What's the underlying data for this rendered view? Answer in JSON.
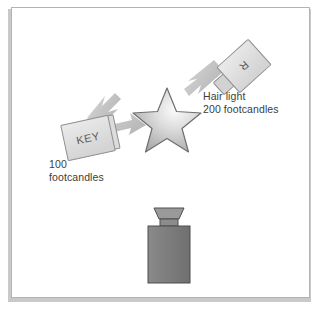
{
  "diagram": {
    "background_color": "#ffffff",
    "frame_border_color": "#b3b3b3",
    "shadow_color": "#c9c9c9",
    "text_color": "#3c3c3c"
  },
  "lights": [
    {
      "id": "key",
      "box_label": "KEY",
      "caption_line1": "100",
      "caption_line2": "footcandles",
      "intensity_value": 100,
      "intensity_unit": "footcandles",
      "box_fill": "#e3e3e3",
      "box_stroke": "#8f8f8f",
      "rotation_deg": -12,
      "arrow_color": "#c6c6c6"
    },
    {
      "id": "hair",
      "box_label": "R",
      "caption_line1": "Hair light",
      "caption_line2": "200 footcandles",
      "intensity_value": 200,
      "intensity_unit": "footcandles",
      "box_fill": "#e3e3e3",
      "box_stroke": "#8f8f8f",
      "rotation_deg": -45,
      "arrow_color": "#c6c6c6"
    }
  ],
  "subject": {
    "id": "star",
    "shape": "star",
    "fill_highlight": "#f2f2f2",
    "fill_base": "#b6b6b6",
    "stroke": "#6e6e6e"
  },
  "camera": {
    "id": "camera",
    "body_fill": "#7e7e7e",
    "lens_fill": "#909090",
    "stroke": "#4e4e4e"
  }
}
